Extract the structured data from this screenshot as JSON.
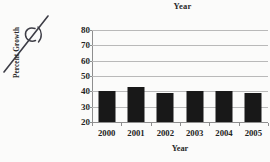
{
  "annotation": {
    "text": "C)",
    "name": "handwritten-annotation"
  },
  "chart_data": {
    "type": "bar",
    "title": "Year",
    "xlabel": "Year",
    "ylabel": "Percent Growth",
    "categories": [
      "2000",
      "2001",
      "2002",
      "2003",
      "2004",
      "2005"
    ],
    "values": [
      40.5,
      43,
      39,
      40.5,
      40.5,
      39
    ],
    "ylim": [
      20,
      80
    ],
    "yticks": [
      80,
      70,
      60,
      50,
      40,
      30,
      20
    ],
    "ytick_labels": [
      "80",
      "70",
      "60",
      "50",
      "40",
      "30",
      "20"
    ],
    "grid": true,
    "legend": false,
    "bar_color": "#181818",
    "grid_color": "#b9b9b9",
    "axis_color": "#8e8e8e",
    "background_color": "#fbfbfa"
  }
}
